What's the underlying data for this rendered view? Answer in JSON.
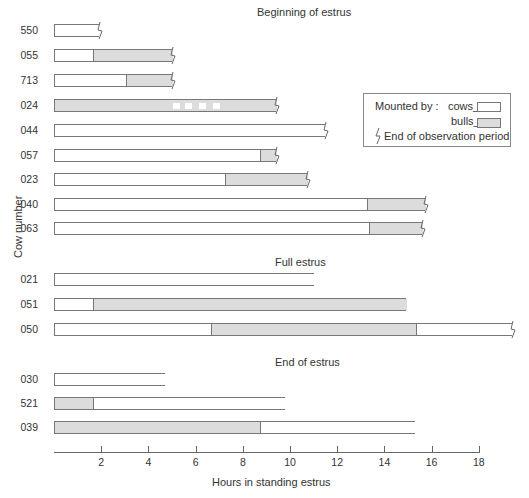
{
  "chart_data": {
    "type": "bar",
    "orientation": "horizontal-stacked",
    "xlabel": "Hours in standing estrus",
    "ylabel": "Cow number",
    "xlim": [
      0,
      18
    ],
    "xticks": [
      2,
      4,
      6,
      8,
      10,
      12,
      14,
      16,
      18
    ],
    "legend": {
      "title": "Mounted by :",
      "entries": [
        {
          "label": "cows_",
          "color": "#ffffff"
        },
        {
          "label": "bulls_",
          "color": "#dcdcdc"
        }
      ],
      "break_symbol_label": "End of observation period",
      "position": "right"
    },
    "groups": [
      {
        "title": "Beginning of estrus",
        "rows": [
          {
            "cow": "550",
            "segments": [
              {
                "by": "cows",
                "start": 0,
                "end": 1.9
              }
            ],
            "observation_ended": true
          },
          {
            "cow": "055",
            "segments": [
              {
                "by": "cows",
                "start": 0,
                "end": 1.6
              },
              {
                "by": "bulls",
                "start": 1.6,
                "end": 5.0
              }
            ],
            "observation_ended": true
          },
          {
            "cow": "713",
            "segments": [
              {
                "by": "cows",
                "start": 0,
                "end": 3.0
              },
              {
                "by": "bulls",
                "start": 3.0,
                "end": 5.0
              }
            ],
            "observation_ended": true
          },
          {
            "cow": "024",
            "segments": [
              {
                "by": "bulls",
                "start": 0,
                "end": 9.4
              }
            ],
            "observation_ended": true,
            "gaps": [
              5.0,
              5.5,
              6.1,
              6.7
            ]
          },
          {
            "cow": "044",
            "segments": [
              {
                "by": "cows",
                "start": 0,
                "end": 11.5
              }
            ],
            "observation_ended": true
          },
          {
            "cow": "057",
            "segments": [
              {
                "by": "cows",
                "start": 0,
                "end": 8.7
              },
              {
                "by": "bulls",
                "start": 8.7,
                "end": 9.4
              }
            ],
            "observation_ended": true
          },
          {
            "cow": "023",
            "segments": [
              {
                "by": "cows",
                "start": 0,
                "end": 7.2
              },
              {
                "by": "bulls",
                "start": 7.2,
                "end": 10.7
              }
            ],
            "observation_ended": true
          },
          {
            "cow": "040",
            "segments": [
              {
                "by": "cows",
                "start": 0,
                "end": 13.2
              },
              {
                "by": "bulls",
                "start": 13.2,
                "end": 15.7
              }
            ],
            "observation_ended": true
          },
          {
            "cow": "063",
            "segments": [
              {
                "by": "cows",
                "start": 0,
                "end": 13.3
              },
              {
                "by": "bulls",
                "start": 13.3,
                "end": 15.6
              }
            ],
            "observation_ended": true
          }
        ]
      },
      {
        "title": "Full estrus",
        "rows": [
          {
            "cow": "021",
            "segments": [
              {
                "by": "cows",
                "start": 0,
                "end": 11.0
              }
            ],
            "observation_ended": false
          },
          {
            "cow": "051",
            "segments": [
              {
                "by": "cows",
                "start": 0,
                "end": 1.6
              },
              {
                "by": "bulls",
                "start": 1.6,
                "end": 14.9
              }
            ],
            "observation_ended": false
          },
          {
            "cow": "050",
            "segments": [
              {
                "by": "cows",
                "start": 0,
                "end": 6.6
              },
              {
                "by": "bulls",
                "start": 6.6,
                "end": 15.3
              },
              {
                "by": "cows",
                "start": 15.3,
                "end": 19.4
              }
            ],
            "observation_ended": true
          }
        ]
      },
      {
        "title": "End of estrus",
        "rows": [
          {
            "cow": "030",
            "segments": [
              {
                "by": "cows",
                "start": 0,
                "end": 4.7
              }
            ],
            "observation_ended": false
          },
          {
            "cow": "521",
            "segments": [
              {
                "by": "bulls",
                "start": 0,
                "end": 1.6
              },
              {
                "by": "cows",
                "start": 1.6,
                "end": 9.8
              }
            ],
            "observation_ended": false
          },
          {
            "cow": "039",
            "segments": [
              {
                "by": "bulls",
                "start": 0,
                "end": 8.7
              },
              {
                "by": "cows",
                "start": 8.7,
                "end": 15.3
              }
            ],
            "observation_ended": false
          }
        ]
      }
    ]
  },
  "layout": {
    "x0": 54,
    "px_per_hour": 23.6,
    "group_title_pos": [
      [
        257,
        6
      ],
      [
        275,
        256
      ],
      [
        275,
        356
      ]
    ],
    "row_tops": [
      [
        24,
        49,
        74,
        99,
        124,
        149,
        173,
        198,
        222
      ],
      [
        273,
        298,
        323
      ],
      [
        373,
        397,
        421
      ]
    ]
  }
}
